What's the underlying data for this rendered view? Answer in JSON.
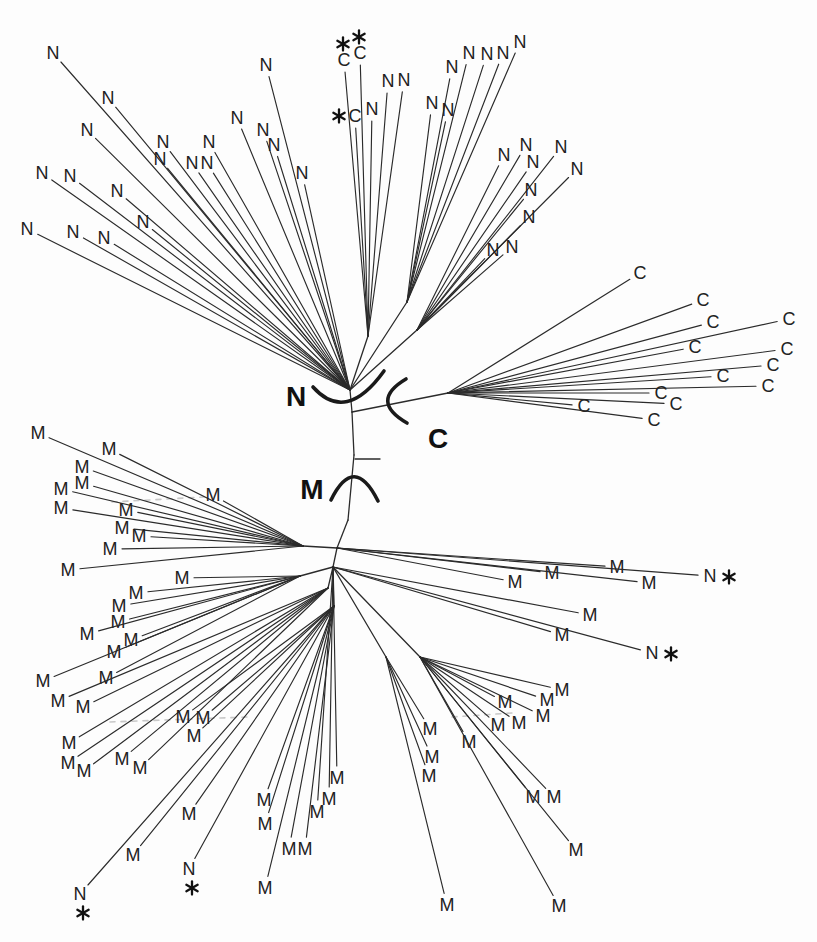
{
  "figure": {
    "width": 817,
    "height": 942,
    "background": "#fdfdfd"
  },
  "style": {
    "branch_color": "#2b2b2b",
    "branch_width": 1.15,
    "tip_font_size": 18,
    "tip_color": "#222222",
    "region_font_size": 28,
    "region_color": "#111111",
    "arc_color": "#1a1a1a",
    "arc_width": 3.6,
    "star_color": "#111111",
    "dash_color": "#c8c8c8",
    "label_gap": 12
  },
  "tree": {
    "hubs": {
      "hubN": [
        350,
        390
      ],
      "t1": [
        352,
        412
      ],
      "t2": [
        354,
        455
      ],
      "t3": [
        348,
        520
      ],
      "hubM1": [
        337,
        548
      ],
      "hubM2": [
        333,
        567
      ],
      "nMid": [
        368,
        336
      ],
      "nR1": [
        407,
        302
      ],
      "nR2": [
        417,
        330
      ],
      "hubC": [
        448,
        393
      ],
      "mhA": [
        303,
        546
      ],
      "mhB": [
        300,
        576
      ],
      "mhC1": [
        328,
        588
      ],
      "mhC2": [
        334,
        606
      ],
      "mhS1": [
        386,
        657
      ],
      "mhE": [
        420,
        657
      ]
    },
    "edges": [
      [
        "hubN",
        "t1"
      ],
      [
        "t1",
        "t2"
      ],
      [
        "t2",
        "t3"
      ],
      [
        "t3",
        "hubM1"
      ],
      [
        "hubM1",
        "hubM2"
      ],
      [
        "hubN",
        "nMid"
      ],
      [
        "hubN",
        "nR1"
      ],
      [
        "hubN",
        "nR2"
      ],
      [
        "t1",
        "hubC"
      ],
      [
        "hubM1",
        "mhA"
      ],
      [
        "hubM2",
        "mhB"
      ],
      [
        "hubM2",
        "mhC1"
      ],
      [
        "hubM2",
        "mhC2"
      ],
      [
        "hubM2",
        "mhS1"
      ],
      [
        "hubM2",
        "mhE"
      ]
    ],
    "clusters": [
      {
        "hub": "hubN",
        "tips": [
          [
            53,
            53,
            "N"
          ],
          [
            108,
            98,
            "N"
          ],
          [
            87,
            130,
            "N"
          ],
          [
            266,
            65,
            "N"
          ],
          [
            163,
            142,
            "N"
          ],
          [
            160,
            159,
            "N"
          ],
          [
            192,
            163,
            "N"
          ],
          [
            207,
            163,
            "N"
          ],
          [
            209,
            142,
            "N"
          ],
          [
            237,
            118,
            "N"
          ],
          [
            263,
            130,
            "N"
          ],
          [
            274,
            145,
            "N"
          ],
          [
            302,
            173,
            "N"
          ],
          [
            27,
            229,
            "N"
          ],
          [
            42,
            173,
            "N"
          ],
          [
            70,
            176,
            "N"
          ],
          [
            73,
            232,
            "N"
          ],
          [
            104,
            238,
            "N"
          ],
          [
            117,
            191,
            "N"
          ],
          [
            143,
            222,
            "N"
          ]
        ]
      },
      {
        "hub": "nMid",
        "tips": [
          [
            344,
            60,
            "C",
            "above"
          ],
          [
            360,
            53,
            "C",
            "above"
          ],
          [
            388,
            81,
            "N"
          ],
          [
            404,
            80,
            "N"
          ],
          [
            355,
            116,
            "C",
            "left"
          ],
          [
            372,
            109,
            "N"
          ]
        ]
      },
      {
        "hub": "nR1",
        "tips": [
          [
            452,
            67,
            "N"
          ],
          [
            469,
            53,
            "N"
          ],
          [
            487,
            54,
            "N"
          ],
          [
            503,
            53,
            "N"
          ],
          [
            520,
            42,
            "N"
          ],
          [
            432,
            103,
            "N"
          ],
          [
            448,
            110,
            "N"
          ]
        ]
      },
      {
        "hub": "nR2",
        "tips": [
          [
            504,
            155,
            "N"
          ],
          [
            526,
            145,
            "N"
          ],
          [
            533,
            162,
            "N"
          ],
          [
            561,
            147,
            "N"
          ],
          [
            577,
            169,
            "N"
          ],
          [
            531,
            190,
            "N"
          ],
          [
            529,
            217,
            "N"
          ],
          [
            493,
            250,
            "N"
          ],
          [
            512,
            247,
            "N"
          ]
        ]
      },
      {
        "hub": "hubC",
        "tips": [
          [
            640,
            273,
            "C"
          ],
          [
            703,
            300,
            "C"
          ],
          [
            713,
            322,
            "C"
          ],
          [
            789,
            319,
            "C"
          ],
          [
            695,
            347,
            "C"
          ],
          [
            787,
            349,
            "C"
          ],
          [
            773,
            365,
            "C"
          ],
          [
            723,
            376,
            "C"
          ],
          [
            768,
            386,
            "C"
          ],
          [
            661,
            393,
            "C"
          ],
          [
            676,
            404,
            "C"
          ],
          [
            584,
            406,
            "C"
          ],
          [
            654,
            420,
            "C"
          ]
        ]
      },
      {
        "hub": "mhA",
        "tips": [
          [
            38,
            433,
            "M"
          ],
          [
            109,
            449,
            "M"
          ],
          [
            82,
            467,
            "M"
          ],
          [
            82,
            483,
            "M"
          ],
          [
            61,
            489,
            "M"
          ],
          [
            213,
            495,
            "M"
          ],
          [
            61,
            508,
            "M"
          ],
          [
            126,
            510,
            "M"
          ],
          [
            122,
            528,
            "M"
          ],
          [
            139,
            536,
            "M"
          ],
          [
            110,
            549,
            "M"
          ],
          [
            68,
            570,
            "M"
          ]
        ]
      },
      {
        "hub": "hubM1",
        "tips": [
          [
            515,
            582,
            "M"
          ],
          [
            552,
            573,
            "M"
          ],
          [
            617,
            567,
            "M"
          ],
          [
            649,
            583,
            "M"
          ],
          [
            710,
            576,
            "N",
            "right"
          ]
        ]
      },
      {
        "hub": "mhB",
        "tips": [
          [
            182,
            578,
            "M"
          ],
          [
            136,
            593,
            "M"
          ],
          [
            119,
            606,
            "M"
          ],
          [
            118,
            622,
            "M"
          ],
          [
            87,
            634,
            "M"
          ],
          [
            131,
            640,
            "M"
          ],
          [
            114,
            652,
            "M"
          ],
          [
            43,
            681,
            "M"
          ],
          [
            106,
            678,
            "M"
          ]
        ]
      },
      {
        "hub": "hubM2",
        "tips": [
          [
            590,
            615,
            "M"
          ],
          [
            562,
            635,
            "M"
          ],
          [
            652,
            653,
            "N",
            "right"
          ],
          [
            337,
            778,
            "M"
          ],
          [
            329,
            799,
            "M"
          ],
          [
            317,
            812,
            "M"
          ]
        ]
      },
      {
        "hub": "mhC1",
        "tips": [
          [
            58,
            701,
            "M"
          ],
          [
            83,
            707,
            "M"
          ],
          [
            69,
            743,
            "M"
          ],
          [
            68,
            763,
            "M"
          ],
          [
            84,
            771,
            "M"
          ],
          [
            122,
            759,
            "M"
          ],
          [
            140,
            768,
            "M"
          ]
        ]
      },
      {
        "hub": "mhC2",
        "tips": [
          [
            133,
            855,
            "M"
          ],
          [
            80,
            894,
            "N",
            "below"
          ],
          [
            183,
            717,
            "M"
          ],
          [
            203,
            718,
            "M"
          ],
          [
            194,
            736,
            "M"
          ],
          [
            189,
            814,
            "M"
          ],
          [
            189,
            869,
            "N",
            "below"
          ],
          [
            264,
            800,
            "M"
          ],
          [
            265,
            824,
            "M"
          ],
          [
            289,
            849,
            "M"
          ],
          [
            305,
            849,
            "M"
          ],
          [
            265,
            888,
            "M"
          ]
        ]
      },
      {
        "hub": "mhS1",
        "tips": [
          [
            430,
            729,
            "M"
          ],
          [
            432,
            757,
            "M"
          ],
          [
            429,
            776,
            "M"
          ],
          [
            447,
            905,
            "M"
          ]
        ]
      },
      {
        "hub": "mhE",
        "tips": [
          [
            562,
            690,
            "M"
          ],
          [
            547,
            700,
            "M"
          ],
          [
            505,
            702,
            "M"
          ],
          [
            519,
            723,
            "M"
          ],
          [
            543,
            716,
            "M"
          ],
          [
            498,
            725,
            "M"
          ],
          [
            469,
            742,
            "M"
          ],
          [
            533,
            797,
            "M"
          ],
          [
            554,
            797,
            "M"
          ],
          [
            576,
            850,
            "M"
          ],
          [
            559,
            906,
            "M"
          ]
        ]
      }
    ],
    "region_labels": [
      {
        "text": "N",
        "x": 296,
        "y": 397
      },
      {
        "text": "C",
        "x": 438,
        "y": 439
      },
      {
        "text": "M",
        "x": 312,
        "y": 490
      }
    ],
    "arcs": [
      "M313,387 Q346,424 384,371",
      "M406,379 Q369,401 407,423",
      "M331,500 Q354,453 378,501"
    ],
    "scalebar": {
      "x1": 355,
      "y1": 459,
      "x2": 380,
      "y2": 459
    },
    "faint_dashes": [
      [
        112,
        502,
        204,
        497
      ],
      [
        110,
        722,
        248,
        717
      ],
      [
        452,
        717,
        512,
        713
      ]
    ]
  }
}
